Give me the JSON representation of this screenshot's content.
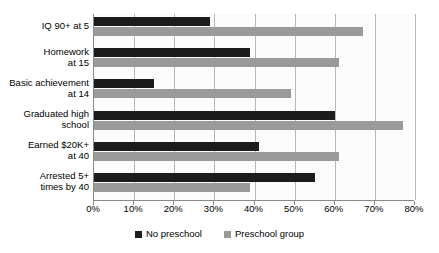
{
  "chart_data": {
    "type": "bar",
    "orientation": "horizontal",
    "title": "",
    "subtitle": "",
    "xlabel": "",
    "ylabel": "",
    "xlim": [
      0,
      80
    ],
    "xtick_values": [
      0,
      10,
      20,
      30,
      40,
      50,
      60,
      70,
      80
    ],
    "xtick_labels": [
      "0%",
      "10%",
      "20%",
      "30%",
      "40%",
      "50%",
      "60%",
      "70%",
      "80%"
    ],
    "grid": true,
    "grid_axis": "x",
    "legend_position": "bottom-center",
    "categories": [
      "IQ 90+ at 5",
      "Homework\nat 15",
      "Basic achievement\nat 14",
      "Graduated high\nschool",
      "Earned $20K+\nat 40",
      "Arrested 5+\ntimes by 40"
    ],
    "series": [
      {
        "name": "No preschool",
        "color": "#1c1c1c",
        "values": [
          29,
          39,
          15,
          60,
          41,
          55
        ]
      },
      {
        "name": "Preschool group",
        "color": "#9a9a9a",
        "values": [
          67,
          61,
          49,
          77,
          61,
          39
        ]
      }
    ]
  },
  "legend": {
    "items": [
      {
        "label": "No preschool",
        "swatch": "dark"
      },
      {
        "label": "Preschool group",
        "swatch": "light"
      }
    ]
  },
  "colors": {
    "series_dark": "#1c1c1c",
    "series_light": "#9a9a9a",
    "axis": "#8a8a8a",
    "gridline": "#b9b9b9",
    "plot_background": "#fcfcfc",
    "page_background": "#ffffff",
    "text": "#000000"
  }
}
